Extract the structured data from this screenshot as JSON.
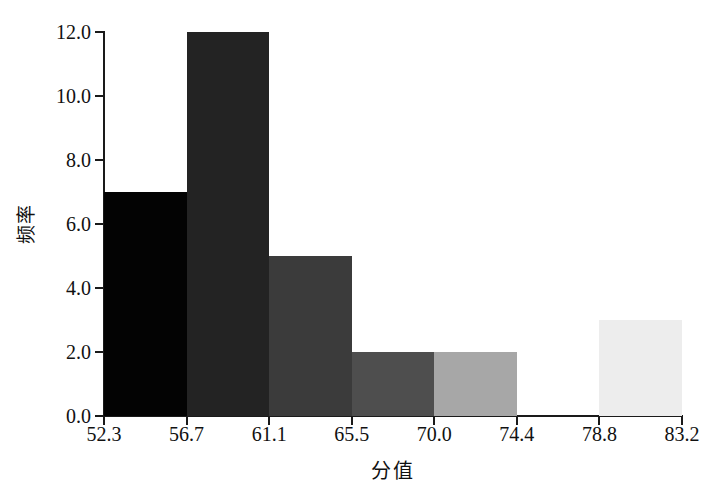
{
  "chart_data": {
    "type": "bar",
    "title": "",
    "subtitle": "",
    "xlabel": "分值",
    "ylabel": "频率",
    "categories": [
      "52.3-56.7",
      "56.7-61.1",
      "61.1-65.5",
      "65.5-70.0",
      "70.0-74.4",
      "74.4-78.8",
      "78.8-83.2"
    ],
    "values": [
      7,
      12,
      5,
      2,
      2,
      0,
      3
    ],
    "bin_edges": [
      52.3,
      56.7,
      61.1,
      65.5,
      70.0,
      74.4,
      78.8,
      83.2
    ],
    "x_tick_labels": [
      "52.3",
      "56.7",
      "61.1",
      "65.5",
      "70.0",
      "74.4",
      "78.8",
      "83.2"
    ],
    "y_tick_labels": [
      "0.0",
      "2.0",
      "4.0",
      "6.0",
      "8.0",
      "10.0",
      "12.0"
    ],
    "y_tick_values": [
      0,
      2,
      4,
      6,
      8,
      10,
      12
    ],
    "ylim": [
      0,
      12
    ],
    "xlim": [
      52.3,
      83.2
    ],
    "grid": false,
    "legend": "none",
    "bar_colors": [
      "#030303",
      "#232323",
      "#3b3b3b",
      "#4e4e4e",
      "#a7a7a7",
      "#ffffff",
      "#ededed"
    ],
    "axis_color": "#1a1a1a",
    "background": "#ffffff",
    "text_color": "#111111"
  }
}
